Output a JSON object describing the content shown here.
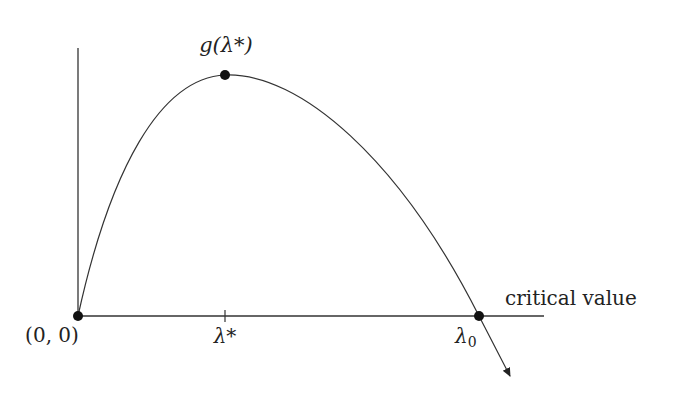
{
  "diagram": {
    "labels": {
      "peak": "g(λ*)",
      "origin": "(0, 0)",
      "lambda_star": "λ*",
      "lambda_zero_base": "λ",
      "lambda_zero_sub": "0",
      "axis": "critical value"
    },
    "points": {
      "origin": {
        "x": 78,
        "y": 316
      },
      "peak": {
        "x": 225,
        "y": 75
      },
      "lambda_zero": {
        "x": 479,
        "y": 316
      }
    },
    "colors": {
      "stroke": "#333333",
      "dot": "#111111",
      "text": "#222222"
    }
  }
}
